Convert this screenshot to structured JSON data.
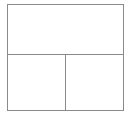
{
  "figure": {
    "kind": "layout-wireframe",
    "canvas": {
      "width_px": 132,
      "height_px": 119,
      "background_color": "#ffffff"
    },
    "stroke": {
      "color": "#8a8a8a",
      "width_px": 1,
      "style": "solid"
    },
    "outer_frame": {
      "left_px": 7,
      "top_px": 4,
      "right_px": 124,
      "bottom_px": 111,
      "width_px": 117,
      "height_px": 107,
      "fill_color": "#ffffff"
    },
    "dividers": [
      {
        "orientation": "horizontal",
        "position_px": 55,
        "spans_full_width": true
      },
      {
        "orientation": "vertical",
        "position_px": 66,
        "spans_full_height": false,
        "region": "bottom-row-only"
      }
    ],
    "panes": [
      {
        "id": "top",
        "label": "",
        "row": 1,
        "column": 1,
        "column_span": 2,
        "fill_color": "#ffffff",
        "text": ""
      },
      {
        "id": "bottom-left",
        "label": "",
        "row": 2,
        "column": 1,
        "column_span": 1,
        "fill_color": "#ffffff",
        "text": ""
      },
      {
        "id": "bottom-right",
        "label": "",
        "row": 2,
        "column": 2,
        "column_span": 1,
        "fill_color": "#ffffff",
        "text": ""
      }
    ],
    "pane_count": 3
  }
}
